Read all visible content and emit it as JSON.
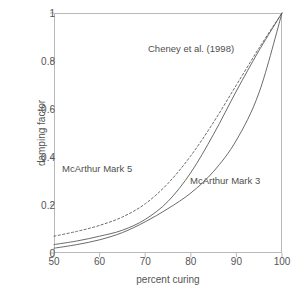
{
  "chart_data": {
    "type": "line",
    "title": "",
    "xlabel": "percent curing",
    "ylabel": "damping factor",
    "xlim": [
      50,
      100
    ],
    "ylim": [
      0,
      1
    ],
    "xticks": [
      50,
      60,
      70,
      80,
      90,
      100
    ],
    "yticks": [
      0,
      0.2,
      0.4,
      0.6,
      0.8,
      1
    ],
    "xtick_labels": [
      "50",
      "60",
      "70",
      "80",
      "90",
      "100"
    ],
    "ytick_labels": [
      "0",
      "0.2",
      "0.4",
      "0.6",
      "0.8",
      "1"
    ],
    "grid": false,
    "legend_position": "inline-annotations",
    "frame": true,
    "line_color": "#5a5a5a",
    "axis_color": "#b9b9b9",
    "background": "#ffffff",
    "x": [
      50,
      55,
      60,
      65,
      70,
      75,
      80,
      85,
      90,
      95,
      100
    ],
    "series": [
      {
        "name": "Cheney et al. (1998)",
        "style": "dashed",
        "color": "#5a5a5a",
        "values": [
          0.07,
          0.09,
          0.115,
          0.15,
          0.205,
          0.29,
          0.405,
          0.545,
          0.7,
          0.855,
          1.0
        ]
      },
      {
        "name": "McArthur Mark 5",
        "style": "solid",
        "color": "#5a5a5a",
        "values": [
          0.035,
          0.05,
          0.07,
          0.095,
          0.14,
          0.215,
          0.335,
          0.495,
          0.675,
          0.845,
          1.0
        ]
      },
      {
        "name": "McArthur Mark 3",
        "style": "solid",
        "color": "#5a5a5a",
        "values": [
          0.02,
          0.035,
          0.055,
          0.085,
          0.13,
          0.185,
          0.25,
          0.34,
          0.47,
          0.67,
          1.0
        ]
      }
    ],
    "annotations": [
      {
        "text": "Cheney et al. (1998)",
        "x": 71.5,
        "y": 0.84
      },
      {
        "text": "McArthur Mark 5",
        "x": 52.0,
        "y": 0.335
      },
      {
        "text": "McArthur Mark 3",
        "x": 80.0,
        "y": 0.285
      }
    ]
  }
}
